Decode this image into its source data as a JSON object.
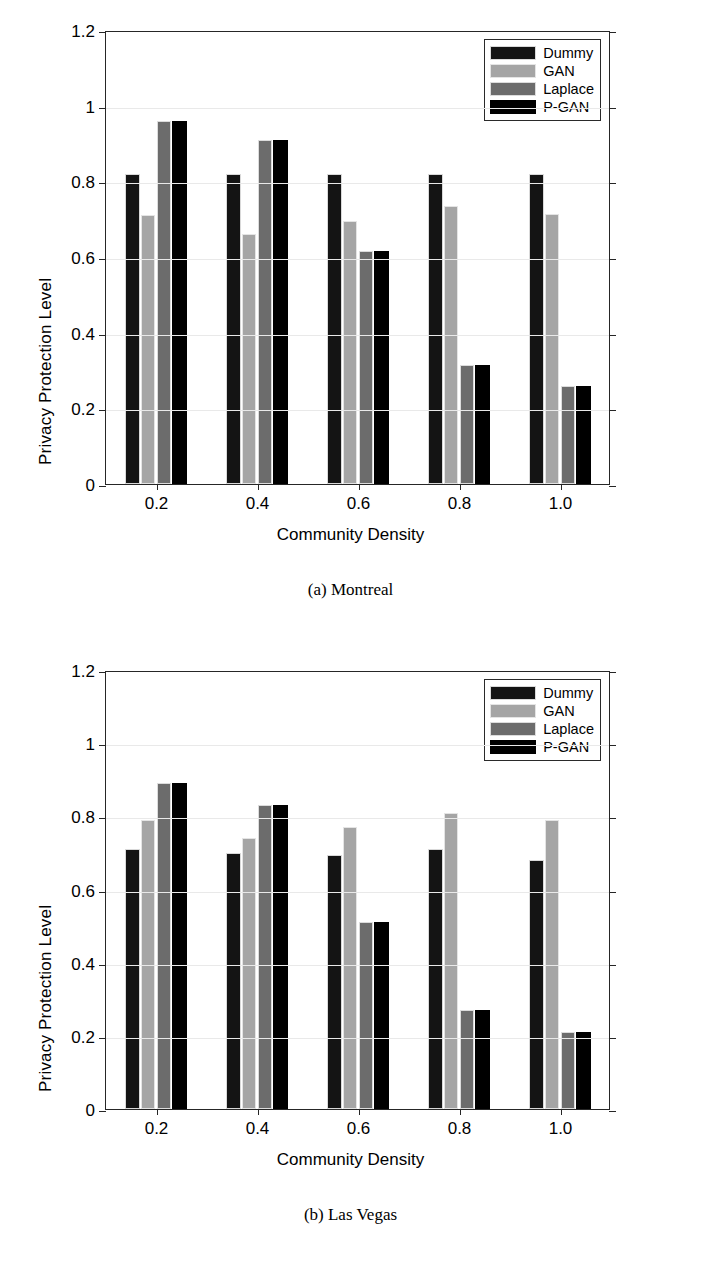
{
  "figure_a": {
    "caption": "(a) Montreal",
    "legend": {
      "items": [
        {
          "label": "Dummy",
          "color": "#141414"
        },
        {
          "label": "GAN",
          "color": "#a5a5a5"
        },
        {
          "label": "Laplace",
          "color": "#6c6c6c"
        },
        {
          "label": "P-GAN",
          "color": "#000000"
        }
      ]
    }
  },
  "figure_b": {
    "caption": "(b) Las Vegas",
    "legend": {
      "items": [
        {
          "label": "Dummy",
          "color": "#141414"
        },
        {
          "label": "GAN",
          "color": "#a5a5a5"
        },
        {
          "label": "Laplace",
          "color": "#6c6c6c"
        },
        {
          "label": "P-GAN",
          "color": "#000000"
        }
      ]
    }
  },
  "chart_data": [
    {
      "type": "bar",
      "title": "(a) Montreal",
      "xlabel": "Community Density",
      "ylabel": "Privacy Protection Level",
      "categories": [
        "0.2",
        "0.4",
        "0.6",
        "0.8",
        "1.0"
      ],
      "ytick_labels": [
        "0",
        "0.2",
        "0.4",
        "0.6",
        "0.8",
        "1",
        "1.2"
      ],
      "ytick_values": [
        0,
        0.2,
        0.4,
        0.6,
        0.8,
        1.0,
        1.2
      ],
      "ylim": [
        0,
        1.2
      ],
      "grid": true,
      "legend_position": "top-right",
      "series": [
        {
          "name": "Dummy",
          "color": "#141414",
          "values": [
            0.82,
            0.82,
            0.82,
            0.82,
            0.82
          ]
        },
        {
          "name": "GAN",
          "color": "#a5a5a5",
          "values": [
            0.71,
            0.66,
            0.695,
            0.735,
            0.715
          ]
        },
        {
          "name": "Laplace",
          "color": "#6c6c6c",
          "values": [
            0.96,
            0.91,
            0.615,
            0.315,
            0.26
          ]
        },
        {
          "name": "P-GAN",
          "color": "#000000",
          "values": [
            0.96,
            0.91,
            0.615,
            0.315,
            0.26
          ]
        }
      ]
    },
    {
      "type": "bar",
      "title": "(b) Las Vegas",
      "xlabel": "Community Density",
      "ylabel": "Privacy Protection Level",
      "categories": [
        "0.2",
        "0.4",
        "0.6",
        "0.8",
        "1.0"
      ],
      "ytick_labels": [
        "0",
        "0.2",
        "0.4",
        "0.6",
        "0.8",
        "1",
        "1.2"
      ],
      "ytick_values": [
        0,
        0.2,
        0.4,
        0.6,
        0.8,
        1.0,
        1.2
      ],
      "ylim": [
        0,
        1.2
      ],
      "grid": true,
      "legend_position": "top-right",
      "series": [
        {
          "name": "Dummy",
          "color": "#141414",
          "values": [
            0.71,
            0.7,
            0.695,
            0.71,
            0.68
          ]
        },
        {
          "name": "GAN",
          "color": "#a5a5a5",
          "values": [
            0.79,
            0.74,
            0.77,
            0.81,
            0.79
          ]
        },
        {
          "name": "Laplace",
          "color": "#6c6c6c",
          "values": [
            0.89,
            0.83,
            0.51,
            0.27,
            0.21
          ]
        },
        {
          "name": "P-GAN",
          "color": "#000000",
          "values": [
            0.89,
            0.83,
            0.51,
            0.27,
            0.21
          ]
        }
      ]
    }
  ]
}
